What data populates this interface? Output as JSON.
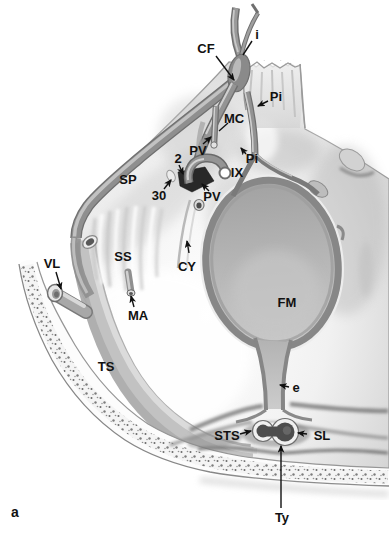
{
  "figure": {
    "panel_letter": "a",
    "labels": {
      "i": "i",
      "cf": "CF",
      "pi_upper": "Pi",
      "mc": "MC",
      "pv_upper": "PV",
      "two": "2",
      "pi_lower": "Pi",
      "sp": "SP",
      "ix": "IX",
      "thirty": "30",
      "pv_lower": "PV",
      "ss": "SS",
      "cy": "CY",
      "vl": "VL",
      "ma": "MA",
      "fm": "FM",
      "ts": "TS",
      "e": "e",
      "sts": "STS",
      "sl": "SL",
      "ty": "Ty"
    },
    "colors": {
      "background": "#ffffff",
      "ink": "#111111",
      "illustration_midtone": "#b5b5b5",
      "illustration_dark": "#1f1f1f"
    }
  }
}
